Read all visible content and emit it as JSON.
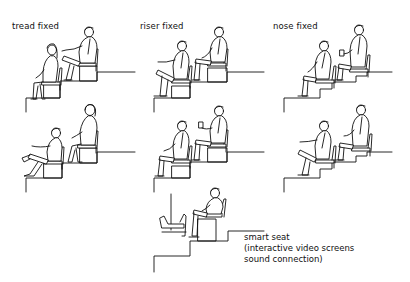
{
  "diagram": {
    "type": "architectural seating section diagrams",
    "labels": {
      "tread_fixed": "tread fixed",
      "riser_fixed": "riser fixed",
      "nose_fixed": "nose fixed"
    },
    "smart_seat": {
      "line1": "smart seat",
      "line2": "(interactive video screens",
      "line3": "sound connection)"
    },
    "panels": [
      {
        "id": "tread-fixed-top",
        "column": "tread fixed",
        "row": 1,
        "figures": [
          "seated woman (front row)",
          "seated man (rear row, legs crossed)"
        ]
      },
      {
        "id": "tread-fixed-bottom",
        "column": "tread fixed",
        "row": 2,
        "figures": [
          "seated man (front row, legs crossed)",
          "seated woman (rear row)"
        ]
      },
      {
        "id": "riser-fixed-top",
        "column": "riser fixed",
        "row": 1,
        "figures": [
          "seated man (front row, legs crossed)",
          "seated man (rear row)"
        ]
      },
      {
        "id": "riser-fixed-bottom",
        "column": "riser fixed",
        "row": 2,
        "figures": [
          "seated man (front row)",
          "seated man (rear row, holding cup)"
        ]
      },
      {
        "id": "nose-fixed-top",
        "column": "nose fixed",
        "row": 1,
        "figures": [
          "seated man (front row)",
          "seated man (rear row, holding cup)"
        ]
      },
      {
        "id": "nose-fixed-bottom",
        "column": "nose fixed",
        "row": 2,
        "figures": [
          "seated man (front row, legs crossed)",
          "seated man (rear row)"
        ]
      },
      {
        "id": "smart-seat",
        "column": "center",
        "row": 3,
        "figures": [
          "seated man with video screen and footrest"
        ]
      }
    ],
    "stroke_color": "#111111",
    "background_color": "#ffffff"
  }
}
